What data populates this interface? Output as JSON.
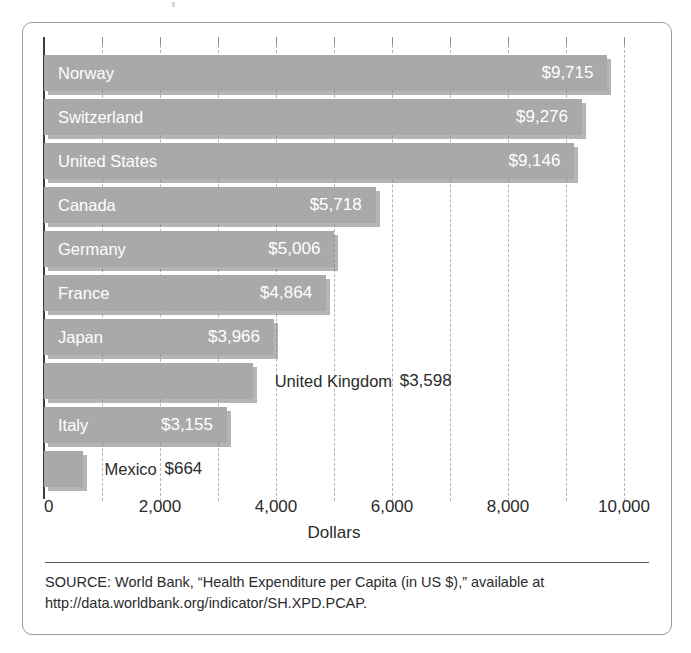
{
  "figure": {
    "source_note": "SOURCE: World Bank, “Health Expenditure per Capita (in US $),” available at http://data.worldbank.org/indicator/SH.XPD.PCAP.",
    "colors": {
      "bar_fill": "#a9a9a9",
      "bar_shadow": "#787878",
      "gridline": "#b4b4b4",
      "axis": "#3c3c3c",
      "inside_label": "#ffffff",
      "outside_label": "#2b2b2b",
      "frame": "#9a9a9a"
    }
  },
  "chart_data": {
    "type": "bar",
    "orientation": "horizontal",
    "title": "",
    "xlabel": "Dollars",
    "ylabel": "",
    "xlim": [
      0,
      10000
    ],
    "grid": true,
    "gridline_interval": 1000,
    "major_tick_interval": 2000,
    "legend": null,
    "categories": [
      "Norway",
      "Switzerland",
      "United States",
      "Canada",
      "Germany",
      "France",
      "Japan",
      "United Kingdom",
      "Italy",
      "Mexico"
    ],
    "values": [
      9715,
      9276,
      9146,
      5718,
      5006,
      4864,
      3966,
      3598,
      3155,
      664
    ],
    "value_labels": [
      "$9,715",
      "$9,276",
      "$9,146",
      "$5,718",
      "$5,006",
      "$4,864",
      "$3,966",
      "$3,598",
      "$3,155",
      "$664"
    ],
    "label_placement": [
      "inside",
      "inside",
      "inside",
      "inside",
      "inside",
      "inside",
      "inside",
      "outside",
      "inside",
      "outside"
    ],
    "x_tick_labels": [
      "0",
      "2,000",
      "4,000",
      "6,000",
      "8,000",
      "10,000"
    ],
    "x_tick_values": [
      0,
      2000,
      4000,
      6000,
      8000,
      10000
    ]
  }
}
